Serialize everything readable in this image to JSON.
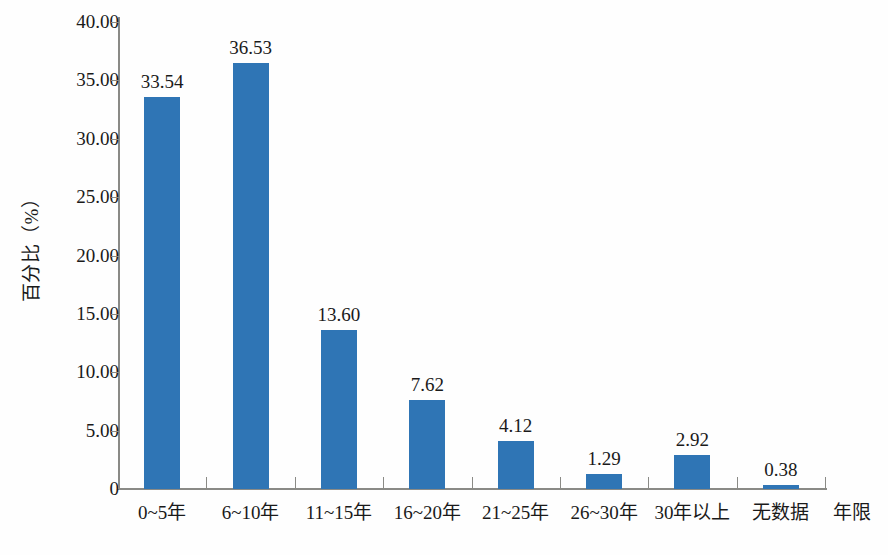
{
  "chart_data": {
    "type": "bar",
    "title": "",
    "xlabel": "年限",
    "ylabel": "百分比（%）",
    "categories": [
      "0~5年",
      "6~10年",
      "11~15年",
      "16~20年",
      "21~25年",
      "26~30年",
      "30年以上",
      "无数据"
    ],
    "values": [
      33.54,
      36.53,
      13.6,
      7.62,
      4.12,
      1.29,
      2.92,
      0.38
    ],
    "value_labels": [
      "33.54",
      "36.53",
      "13.60",
      "7.62",
      "4.12",
      "1.29",
      "2.92",
      "0.38"
    ],
    "ylim": [
      0,
      40
    ],
    "ytick_values": [
      0,
      5,
      10,
      15,
      20,
      25,
      30,
      35,
      40
    ],
    "ytick_labels": [
      "0",
      "5.00",
      "10.00",
      "15.00",
      "20.00",
      "25.00",
      "30.00",
      "35.00",
      "40.00"
    ],
    "grid": false,
    "legend": null,
    "series_color": "#2f75b5",
    "axis_color": "#8a8a86",
    "text_color": "#1a1a1a"
  }
}
